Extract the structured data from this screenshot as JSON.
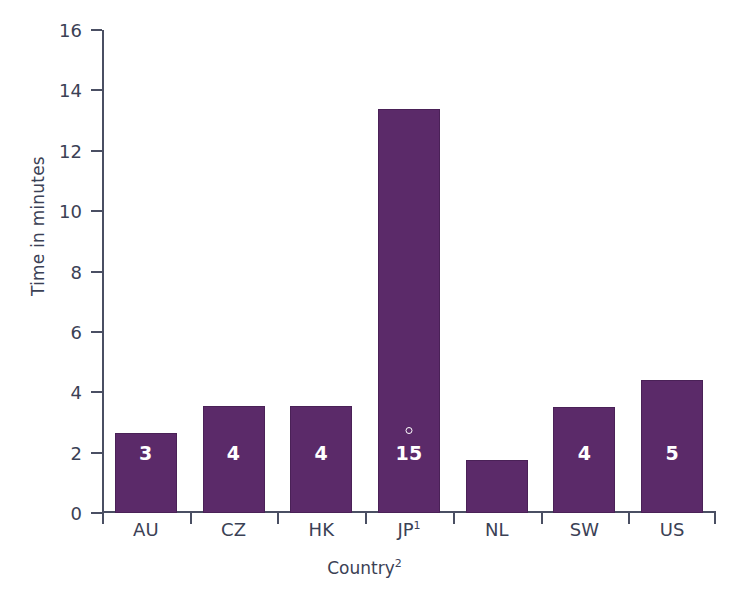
{
  "chart_data": {
    "type": "bar",
    "title": "",
    "subtitle": "",
    "xlabel": "Country",
    "xlabel_superscript": "2",
    "ylabel": "Time in minutes",
    "ylim": [
      0,
      16
    ],
    "yticks": [
      0,
      2,
      4,
      6,
      8,
      10,
      12,
      14,
      16
    ],
    "ytick_labels": [
      "0",
      "2",
      "4",
      "6",
      "8",
      "10",
      "12",
      "14",
      "16"
    ],
    "grid": false,
    "legend": null,
    "categories": [
      "AU",
      "CZ",
      "HK",
      "JP",
      "NL",
      "SW",
      "US"
    ],
    "category_labels": [
      "AU",
      "CZ",
      "HK",
      "JP¹",
      "NL",
      "SW",
      "US"
    ],
    "category_superscripts": [
      "",
      "",
      "",
      "1",
      "",
      "",
      ""
    ],
    "values": [
      2.65,
      3.55,
      3.55,
      13.4,
      1.75,
      3.5,
      4.4
    ],
    "data_labels": [
      "3",
      "4",
      "4",
      "15",
      "2",
      "4",
      "5"
    ],
    "annotations": [
      {
        "category": "JP",
        "kind": "small-circle-marker",
        "value": 2.6
      }
    ],
    "colors": {
      "bar_fill": "#5b2a69",
      "bar_stroke": "#4a2157",
      "axis": "#4a4f63",
      "text": "#3b4155",
      "data_label_text": "#ffffff",
      "background": "#ffffff"
    }
  },
  "axes": {
    "y_title": "Time in minutes",
    "x_title": "Country",
    "x_title_superscript": "2"
  }
}
